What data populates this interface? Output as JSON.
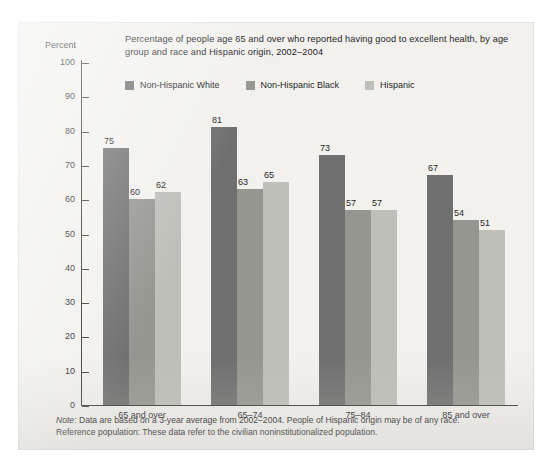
{
  "chart_data": {
    "type": "bar",
    "title": "Percentage of people age 65 and over who reported having good to excellent health, by age group and race and Hispanic origin, 2002–2004",
    "xlabel": "",
    "ylabel": "Percent",
    "ylim": [
      0,
      100
    ],
    "ytick_step": 10,
    "yticks": [
      100,
      90,
      80,
      70,
      60,
      50,
      40,
      30,
      20,
      10,
      0
    ],
    "grid": false,
    "legend_position": "top-left",
    "categories": [
      "65 and over",
      "65–74",
      "75–84",
      "85 and over"
    ],
    "series": [
      {
        "name": "Non-Hispanic White",
        "color": "#6f6f6f",
        "values": [
          75,
          81,
          73,
          67
        ]
      },
      {
        "name": "Non-Hispanic Black",
        "color": "#969691",
        "values": [
          60,
          63,
          57,
          54
        ]
      },
      {
        "name": "Hispanic",
        "color": "#bfbfba",
        "values": [
          62,
          65,
          57,
          51
        ]
      }
    ],
    "note_line_1_label": "Note:",
    "note_line_1": " Data are based on a 3-year average from 2002–2004. People of Hispanic origin may be of any race.",
    "note_line_2_label": "Reference population:",
    "note_line_2": " These data refer to the civilian noninstitutionalized population."
  },
  "axis": {
    "percent_label": "Percent"
  }
}
